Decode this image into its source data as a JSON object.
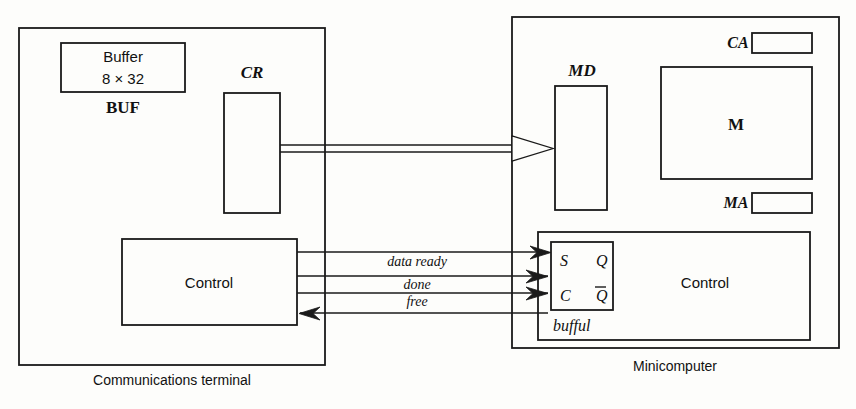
{
  "diagram": {
    "captions": {
      "left": "Communications terminal",
      "right": "Minicomputer"
    },
    "terminal": {
      "buffer_box": {
        "line1": "Buffer",
        "line2": "8 × 32",
        "label": "BUF"
      },
      "cr_register": {
        "label": "CR"
      },
      "control_box": {
        "label": "Control"
      }
    },
    "minicomputer": {
      "md_register": {
        "label": "MD"
      },
      "memory": {
        "label": "M"
      },
      "ca_register": {
        "label": "CA"
      },
      "ma_register": {
        "label": "MA"
      },
      "control_box": {
        "label": "Control"
      },
      "flipflop": {
        "name": "bufful",
        "terminal_s": "S",
        "terminal_q": "Q",
        "terminal_c": "C",
        "terminal_qbar": "Q"
      }
    },
    "signals": [
      {
        "name": "data ready",
        "direction": "right"
      },
      {
        "name": "done",
        "direction": "right"
      },
      {
        "name": "free",
        "direction": "right"
      },
      {
        "name": "return",
        "direction": "left"
      }
    ],
    "data_bus": {
      "from": "CR",
      "to": "MD",
      "style": "double-line-open-arrow"
    },
    "colors": {
      "ink": "#1a1a1a",
      "paper": "#fdfdfb"
    }
  }
}
